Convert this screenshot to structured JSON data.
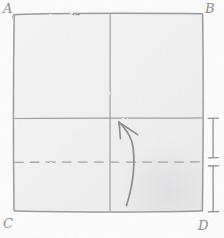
{
  "figure": {
    "type": "hand-drawn-pencil-sketch",
    "medium": "pencil on textured paper",
    "title": "",
    "caption": "",
    "canvas": {
      "width": 224,
      "height": 238
    },
    "paper_color": "#fdfdfd",
    "pencil_color": "#8a8a8e",
    "pencil_color_light": "#b4b4b8"
  },
  "labels": {
    "top_left": "A",
    "top_right": "B",
    "bottom_left": "C",
    "bottom_right": "D"
  },
  "shapes": {
    "square": {
      "name": "square-ABCD",
      "left": 13,
      "top": 13,
      "right": 203,
      "bottom": 212,
      "stroke": "#9a9a9e",
      "fill": "#f4f4f5"
    },
    "vertical_fold": {
      "name": "vertical-center-line",
      "x": 110,
      "y_top": 13,
      "y_bottom": 212,
      "style": "solid"
    },
    "horizontal_fold": {
      "name": "horizontal-line",
      "y": 118,
      "x_left": 13,
      "x_right": 203,
      "style": "solid"
    },
    "dashed_line": {
      "name": "dashed-horizontal-line",
      "y": 162,
      "x_left": 13,
      "x_right": 203,
      "style": "dashed",
      "dash_pattern": "9 6"
    },
    "curved_arrow": {
      "name": "curved-up-arrow",
      "tail_x": 126,
      "tail_y": 205,
      "head_x": 119,
      "head_y": 122,
      "direction": "upward-counterclockwise"
    },
    "bracket": {
      "name": "right-measure-bracket",
      "x": 213,
      "segments": [
        {
          "top": 118,
          "bottom": 158
        },
        {
          "top": 166,
          "bottom": 212
        }
      ],
      "tick_half_width": 5
    }
  }
}
